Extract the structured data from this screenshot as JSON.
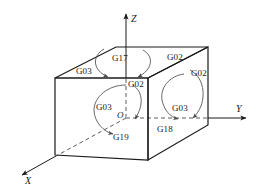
{
  "figure": {
    "type": "isometric-3d-axes-cube",
    "stroke_color": "#1a1a1a",
    "arc_color": "#555555",
    "background": "#ffffff"
  },
  "axes": {
    "z": {
      "label": "Z",
      "direction": "up"
    },
    "y": {
      "label": "Y",
      "direction": "right"
    },
    "x": {
      "label": "X",
      "direction": "down-left"
    },
    "origin": {
      "label": "O"
    }
  },
  "planes": [
    {
      "code": "G17",
      "face": "top",
      "plane": "XY"
    },
    {
      "code": "G18",
      "face": "right",
      "plane": "XZ"
    },
    {
      "code": "G19",
      "face": "front",
      "plane": "YZ"
    }
  ],
  "arc_labels": {
    "top_face": {
      "plane_code": "G17",
      "ccw": "G03",
      "cw_back": "G02",
      "cw_front": "G02"
    },
    "right_face": {
      "plane_code": "G18",
      "cw": "G02",
      "ccw": "G03"
    },
    "front_face": {
      "plane_code": "G19",
      "cw": "G02",
      "ccw": "G03"
    }
  },
  "labels": {
    "g17": "G17",
    "g18": "G18",
    "g19": "G19",
    "g02_top_right": "G02",
    "g02_top_front": "G02",
    "g03_top_left": "G03",
    "g02_right_face": "G02",
    "g03_right_face": "G03",
    "g02_front_face": "G02",
    "g03_front_face": "G03",
    "axis_x": "X",
    "axis_y": "Y",
    "axis_z": "Z",
    "origin": "O"
  }
}
